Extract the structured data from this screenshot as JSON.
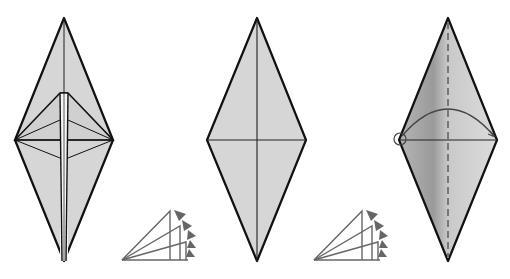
{
  "diagram": {
    "background": "#ffffff",
    "colors": {
      "paper": "#d9d9d9",
      "paper_dark": "#8c8c8c",
      "outline": "#111111",
      "crease": "#222222",
      "arrow": "#666666",
      "valley_dash": "#777777"
    },
    "steps": [
      {
        "id": "step-1",
        "description": "Folded diamond with inner flap layers (bird-base style) showing narrow central ridge",
        "diamond": {
          "top": [
            64,
            18
          ],
          "left": [
            15,
            140
          ],
          "right": [
            113,
            140
          ],
          "bottom": [
            64,
            261
          ]
        }
      },
      {
        "id": "step-2",
        "description": "Plain diamond with vertical and horizontal creases",
        "diamond": {
          "top": [
            257,
            18
          ],
          "left": [
            207,
            140
          ],
          "right": [
            306,
            140
          ],
          "bottom": [
            257,
            261
          ]
        }
      },
      {
        "id": "step-3",
        "description": "Diamond with dashed vertical valley fold, shaded left half, curved arrow from left point to right point, circle marker at left point",
        "diamond": {
          "top": [
            448,
            18
          ],
          "left": [
            399,
            140
          ],
          "right": [
            497,
            140
          ],
          "bottom": [
            448,
            261
          ]
        }
      }
    ],
    "symbols": [
      {
        "id": "repeat-fan-1",
        "type": "unfold/repeat fan arrow",
        "origin": [
          122,
          260
        ]
      },
      {
        "id": "repeat-fan-2",
        "type": "unfold/repeat fan arrow",
        "origin": [
          314,
          260
        ]
      }
    ]
  }
}
